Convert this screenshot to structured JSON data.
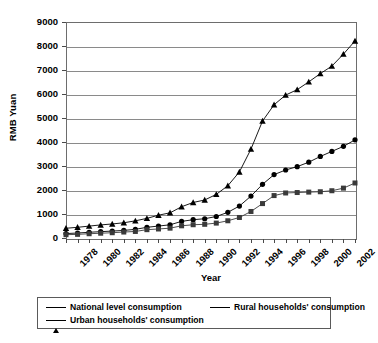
{
  "chart_data": {
    "type": "line",
    "title": "",
    "xlabel": "Year",
    "ylabel": "RMB Yuan",
    "xlim": [
      1978,
      2003
    ],
    "ylim": [
      0,
      9000
    ],
    "ytick_step": 1000,
    "yticks": [
      "0",
      "1000",
      "2000",
      "3000",
      "4000",
      "5000",
      "6000",
      "7000",
      "8000",
      "9000"
    ],
    "x": [
      1978,
      1979,
      1980,
      1981,
      1982,
      1983,
      1984,
      1985,
      1986,
      1987,
      1988,
      1989,
      1990,
      1991,
      1992,
      1993,
      1994,
      1995,
      1996,
      1997,
      1998,
      1999,
      2000,
      2001,
      2002,
      2003
    ],
    "xtick_labels": [
      "1978",
      "1980",
      "1982",
      "1984",
      "1986",
      "1988",
      "1990",
      "1992",
      "1994",
      "1996",
      "1998",
      "2000",
      "2002"
    ],
    "grid": true,
    "legend_position": "bottom",
    "series": [
      {
        "name": "National level consumption",
        "marker": "circle",
        "color": "#000000",
        "values": [
          184,
          208,
          238,
          264,
          288,
          316,
          361,
          446,
          498,
          550,
          693,
          762,
          803,
          896,
          1070,
          1331,
          1746,
          2236,
          2641,
          2834,
          2972,
          3159,
          3397,
          3609,
          3818,
          4089
        ]
      },
      {
        "name": "Rural households' consumption",
        "marker": "square",
        "color": "#3a3a3a",
        "values": [
          138,
          152,
          178,
          199,
          220,
          248,
          273,
          347,
          376,
          410,
          508,
          553,
          571,
          621,
          718,
          855,
          1105,
          1434,
          1768,
          1876,
          1895,
          1912,
          1927,
          1969,
          2078,
          2292
        ]
      },
      {
        "name": "Urban households' consumption",
        "marker": "triangle",
        "color": "#000000",
        "values": [
          405,
          446,
          496,
          545,
          585,
          635,
          715,
          818,
          950,
          1049,
          1303,
          1480,
          1584,
          1817,
          2178,
          2753,
          3702,
          4874,
          5553,
          5954,
          6182,
          6505,
          6850,
          7163,
          7663,
          8212
        ]
      }
    ]
  },
  "axis": {
    "ylabel": "RMB Yuan",
    "xlabel": "Year"
  },
  "legend": {
    "entries": [
      {
        "label": "National level consumption",
        "marker": "circle-marker"
      },
      {
        "label": "Rural households' consumption",
        "marker": "square-marker"
      },
      {
        "label": "Urban households' consumption",
        "marker": "triangle-marker"
      }
    ]
  }
}
